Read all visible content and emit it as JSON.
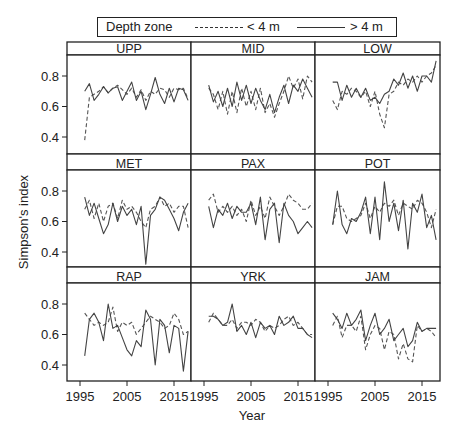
{
  "legend": {
    "title": "Depth zone",
    "shallow_label": "< 4 m",
    "deep_label": "> 4 m"
  },
  "chart_data": {
    "type": "line",
    "title": "",
    "xlabel": "Year",
    "ylabel": "Simpson's index",
    "x_ticks": [
      1995,
      2005,
      2015
    ],
    "y_ticks": [
      0.4,
      0.6,
      0.8
    ],
    "xlim": [
      1992,
      2018
    ],
    "ylim": [
      0.3,
      0.92
    ],
    "grid": false,
    "legend_position": "top",
    "series_styles": {
      "< 4 m": "dashed",
      "> 4 m": "solid"
    },
    "years": [
      1996,
      1997,
      1998,
      1999,
      2000,
      2001,
      2002,
      2003,
      2004,
      2005,
      2006,
      2007,
      2008,
      2009,
      2010,
      2011,
      2012,
      2013,
      2014,
      2015,
      2016,
      2017,
      2018
    ],
    "panels": [
      {
        "name": "UPP",
        "series": [
          {
            "name": "< 4 m",
            "values": [
              0.38,
              0.66,
              0.68,
              0.7,
              0.73,
              0.69,
              0.72,
              0.74,
              0.71,
              0.68,
              0.72,
              0.66,
              0.71,
              0.64,
              0.7,
              0.68,
              0.72,
              0.71,
              0.66,
              0.72,
              0.71,
              0.72,
              0.65
            ]
          },
          {
            "name": "> 4 m",
            "values": [
              0.7,
              0.75,
              0.64,
              0.68,
              0.73,
              0.69,
              0.72,
              0.73,
              0.64,
              0.7,
              0.76,
              0.64,
              0.7,
              0.58,
              0.68,
              0.79,
              0.68,
              0.62,
              0.72,
              0.63,
              0.72,
              0.71,
              0.64
            ]
          }
        ]
      },
      {
        "name": "MID",
        "series": [
          {
            "name": "< 4 m",
            "values": [
              0.72,
              0.68,
              0.58,
              0.7,
              0.55,
              0.7,
              0.56,
              0.72,
              0.6,
              0.7,
              0.58,
              0.72,
              0.56,
              0.62,
              0.53,
              0.62,
              0.7,
              0.8,
              0.72,
              0.78,
              0.65,
              0.8,
              0.76
            ]
          },
          {
            "name": "> 4 m",
            "values": [
              0.74,
              0.63,
              0.7,
              0.6,
              0.72,
              0.6,
              0.76,
              0.64,
              0.74,
              0.62,
              0.72,
              0.64,
              0.58,
              0.68,
              0.56,
              0.66,
              0.74,
              0.62,
              0.74,
              0.7,
              0.78,
              0.72,
              0.66
            ]
          }
        ]
      },
      {
        "name": "LOW",
        "series": [
          {
            "name": "< 4 m",
            "values": [
              0.64,
              0.58,
              0.7,
              0.68,
              0.72,
              0.7,
              0.66,
              0.7,
              0.6,
              0.7,
              0.55,
              0.46,
              0.68,
              0.7,
              0.76,
              0.74,
              0.78,
              0.76,
              0.8,
              0.76,
              0.8,
              0.82,
              0.87
            ]
          },
          {
            "name": "> 4 m",
            "values": [
              0.76,
              0.76,
              0.64,
              0.74,
              0.66,
              0.72,
              0.66,
              0.72,
              0.64,
              0.66,
              0.62,
              0.68,
              0.7,
              0.78,
              0.74,
              0.82,
              0.72,
              0.8,
              0.7,
              0.8,
              0.8,
              0.76,
              0.9
            ]
          }
        ]
      },
      {
        "name": "MET",
        "series": [
          {
            "name": "< 4 m",
            "values": [
              0.68,
              0.74,
              0.62,
              0.72,
              0.6,
              0.7,
              0.72,
              0.62,
              0.74,
              0.68,
              0.7,
              0.66,
              0.6,
              0.56,
              0.68,
              0.7,
              0.76,
              0.7,
              0.72,
              0.66,
              0.7,
              0.7,
              0.56
            ]
          },
          {
            "name": "> 4 m",
            "values": [
              0.76,
              0.64,
              0.72,
              0.62,
              0.52,
              0.58,
              0.72,
              0.6,
              0.7,
              0.64,
              0.68,
              0.58,
              0.7,
              0.32,
              0.64,
              0.68,
              0.76,
              0.74,
              0.68,
              0.62,
              0.54,
              0.66,
              0.72
            ]
          }
        ]
      },
      {
        "name": "PAX",
        "series": [
          {
            "name": "< 4 m",
            "values": [
              0.74,
              0.78,
              0.66,
              0.7,
              0.66,
              0.7,
              0.64,
              0.68,
              0.6,
              0.74,
              0.64,
              0.7,
              0.62,
              0.76,
              0.7,
              0.64,
              0.7,
              0.78,
              0.74,
              0.72,
              0.68,
              0.68,
              0.72
            ]
          },
          {
            "name": "> 4 m",
            "values": [
              0.7,
              0.56,
              0.68,
              0.64,
              0.72,
              0.62,
              0.7,
              0.66,
              0.66,
              0.72,
              0.58,
              0.76,
              0.48,
              0.68,
              0.72,
              0.46,
              0.72,
              0.64,
              0.6,
              0.52,
              0.56,
              0.6,
              0.56
            ]
          }
        ]
      },
      {
        "name": "POT",
        "series": [
          {
            "name": "< 4 m",
            "values": [
              0.58,
              0.7,
              0.7,
              0.62,
              0.6,
              0.62,
              0.64,
              0.72,
              0.62,
              0.7,
              0.66,
              0.72,
              0.7,
              0.74,
              0.64,
              0.72,
              0.7,
              0.68,
              0.74,
              0.72,
              0.66,
              0.56,
              0.68
            ]
          },
          {
            "name": "> 4 m",
            "values": [
              0.58,
              0.8,
              0.58,
              0.52,
              0.62,
              0.6,
              0.66,
              0.76,
              0.52,
              0.76,
              0.48,
              0.86,
              0.6,
              0.72,
              0.54,
              0.74,
              0.42,
              0.72,
              0.66,
              0.78,
              0.56,
              0.64,
              0.48
            ]
          }
        ]
      },
      {
        "name": "RAP",
        "series": [
          {
            "name": "< 4 m",
            "values": [
              0.74,
              0.7,
              0.66,
              0.68,
              0.66,
              0.68,
              0.78,
              0.62,
              0.68,
              0.66,
              0.68,
              0.6,
              0.64,
              0.68,
              0.72,
              0.7,
              0.68,
              0.64,
              0.66,
              0.74,
              0.7,
              0.6,
              0.62
            ]
          },
          {
            "name": "> 4 m",
            "values": [
              0.46,
              0.7,
              0.74,
              0.68,
              0.56,
              0.8,
              0.64,
              0.66,
              0.58,
              0.5,
              0.46,
              0.56,
              0.52,
              0.76,
              0.7,
              0.4,
              0.7,
              0.66,
              0.48,
              0.66,
              0.64,
              0.36,
              0.62
            ]
          }
        ]
      },
      {
        "name": "YRK",
        "series": [
          {
            "name": "< 4 m",
            "values": [
              0.68,
              0.74,
              0.7,
              0.66,
              0.66,
              0.7,
              0.64,
              0.68,
              0.68,
              0.66,
              0.7,
              0.68,
              0.62,
              0.66,
              0.64,
              0.66,
              0.7,
              0.72,
              0.66,
              0.68,
              0.64,
              0.6,
              0.6
            ]
          },
          {
            "name": "> 4 m",
            "values": [
              0.72,
              0.72,
              0.7,
              0.66,
              0.68,
              0.8,
              0.62,
              0.66,
              0.6,
              0.68,
              0.58,
              0.68,
              0.64,
              0.66,
              0.6,
              0.72,
              0.66,
              0.68,
              0.72,
              0.64,
              0.64,
              0.6,
              0.58
            ]
          }
        ]
      },
      {
        "name": "JAM",
        "series": [
          {
            "name": "< 4 m",
            "values": [
              0.66,
              0.72,
              0.58,
              0.66,
              0.66,
              0.62,
              0.72,
              0.5,
              0.6,
              0.66,
              0.64,
              0.5,
              0.62,
              0.6,
              0.44,
              0.54,
              0.44,
              0.42,
              0.66,
              0.62,
              0.64,
              0.62,
              0.58
            ]
          },
          {
            "name": "> 4 m",
            "values": [
              0.74,
              0.7,
              0.64,
              0.74,
              0.66,
              0.7,
              0.76,
              0.56,
              0.66,
              0.74,
              0.6,
              0.64,
              0.7,
              0.56,
              0.6,
              0.64,
              0.52,
              0.56,
              0.68,
              0.62,
              0.64,
              0.64,
              0.64
            ]
          }
        ]
      }
    ]
  }
}
